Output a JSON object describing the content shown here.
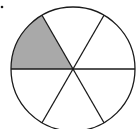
{
  "diagram": {
    "type": "fraction-circle",
    "total_sectors": 6,
    "shaded_sectors": 1,
    "fraction_shaded": "1/6",
    "shaded_sector_index": 2,
    "colors": {
      "stroke": "#1a1a1a",
      "shade": "#a9a9a9",
      "background": "#ffffff"
    },
    "marker": "dot"
  }
}
